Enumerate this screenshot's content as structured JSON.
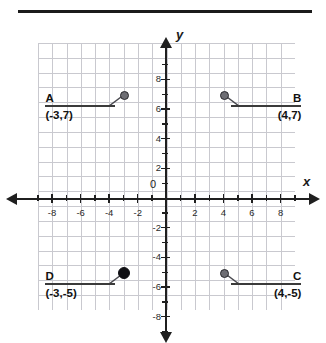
{
  "figure": {
    "axis_labels": {
      "x": "x",
      "y": "y",
      "origin": "0"
    },
    "x_ticks": [
      "-8",
      "-6",
      "-4",
      "-2",
      "2",
      "4",
      "6",
      "8"
    ],
    "y_ticks": [
      "8",
      "6",
      "4",
      "2",
      "-2",
      "-4",
      "-6",
      "-8"
    ],
    "colors": {
      "grid": "#c9c9cf",
      "axis": "#1f1f1f",
      "point": "#6e6e74",
      "point_bold": "#101014",
      "text": "#111111",
      "rule": "#1b1b1b"
    },
    "points": [
      {
        "letter": "A",
        "coord": "(-3,7)",
        "x": -3,
        "y": 7
      },
      {
        "letter": "B",
        "coord": "(4,7)",
        "x": 4,
        "y": 7
      },
      {
        "letter": "C",
        "coord": "(4,-5)",
        "x": 4,
        "y": -5
      },
      {
        "letter": "D",
        "coord": "(-3,-5)",
        "x": -3,
        "y": -5
      }
    ]
  },
  "chart_data": {
    "type": "scatter",
    "title": "",
    "xlabel": "x",
    "ylabel": "y",
    "xlim": [
      -9,
      9
    ],
    "ylim": [
      -9,
      9
    ],
    "xticks": [
      -8,
      -6,
      -4,
      -2,
      2,
      4,
      6,
      8
    ],
    "yticks": [
      8,
      6,
      4,
      2,
      -2,
      -4,
      -6,
      -8
    ],
    "grid": true,
    "legend": "none",
    "series": [
      {
        "name": "labeled points",
        "points": [
          {
            "label": "A",
            "x": -3,
            "y": 7
          },
          {
            "label": "B",
            "x": 4,
            "y": 7
          },
          {
            "label": "C",
            "x": 4,
            "y": -5
          },
          {
            "label": "D",
            "x": -3,
            "y": -5
          }
        ]
      }
    ]
  }
}
